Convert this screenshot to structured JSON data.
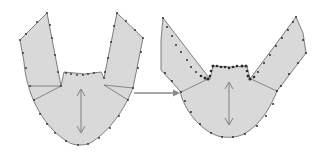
{
  "figure": {
    "colors": {
      "fill": "#d9d9d9",
      "stroke": "#707070",
      "node": "#2b2b2b",
      "arrow": "#8a8a8a",
      "background": "#ffffff"
    },
    "shapes": [
      {
        "name": "initial-mesh",
        "label": ""
      },
      {
        "name": "deformed-mesh",
        "label": ""
      }
    ],
    "transition_arrow": {
      "direction": "right"
    }
  }
}
